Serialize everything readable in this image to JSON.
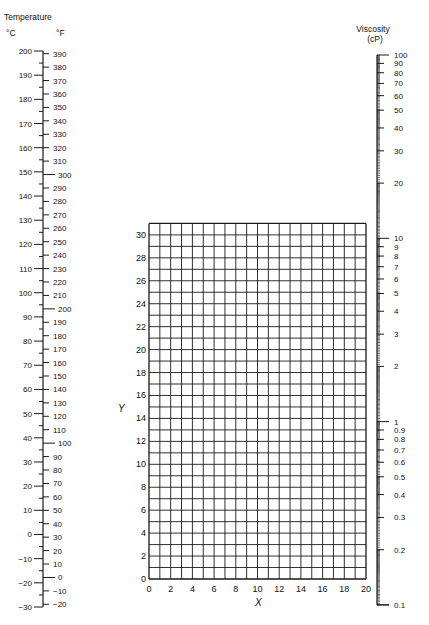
{
  "chart_data": {
    "type": "nomograph",
    "temperature_scale": {
      "title": "Temperature",
      "celsius_label": "°C",
      "fahrenheit_label": "°F",
      "celsius_major_ticks": [
        200,
        190,
        180,
        170,
        160,
        150,
        140,
        130,
        120,
        110,
        100,
        90,
        80,
        70,
        60,
        50,
        40,
        30,
        20,
        10,
        0,
        -10,
        -20,
        -30
      ],
      "fahrenheit_ticks": [
        390,
        380,
        370,
        360,
        350,
        340,
        330,
        320,
        310,
        300,
        290,
        280,
        270,
        260,
        250,
        240,
        230,
        220,
        210,
        200,
        190,
        180,
        170,
        160,
        150,
        140,
        130,
        120,
        110,
        100,
        90,
        80,
        70,
        60,
        50,
        40,
        30,
        20,
        10,
        0,
        -10,
        -20
      ],
      "range_celsius": [
        -30,
        200
      ]
    },
    "grid": {
      "xlabel": "X",
      "ylabel": "Y",
      "x_ticks": [
        0,
        2,
        4,
        6,
        8,
        10,
        12,
        14,
        16,
        18,
        20
      ],
      "y_ticks": [
        0,
        2,
        4,
        6,
        8,
        10,
        12,
        14,
        16,
        18,
        20,
        22,
        24,
        26,
        28,
        30
      ],
      "xlim": [
        0,
        20
      ],
      "ylim": [
        0,
        31
      ],
      "grid": true
    },
    "viscosity_scale": {
      "title": "Viscosity",
      "unit": "(cP)",
      "scale": "log",
      "labels": [
        "100",
        "90",
        "80",
        "70",
        "60",
        "50",
        "40",
        "30",
        "20",
        "10",
        "9",
        "8",
        "7",
        "6",
        "5",
        "4",
        "3",
        "2",
        "1",
        "0.9",
        "0.8",
        "0.7",
        "0.6",
        "0.5",
        "0.4",
        "0.3",
        "0.2",
        "0.1"
      ],
      "range": [
        0.1,
        100
      ]
    }
  },
  "text": {
    "temp_title": "Temperature",
    "c_unit": "°C",
    "f_unit": "°F",
    "visc_title": "Viscosity",
    "visc_unit": "(cP)",
    "x_label": "X",
    "y_label": "Y"
  }
}
